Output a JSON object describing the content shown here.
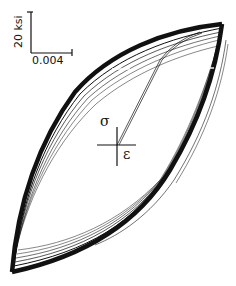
{
  "figure": {
    "type": "stress-strain hysteresis loops (cyclic loading)",
    "scale_bar": {
      "stress_label": "20 ksi",
      "strain_label": "0.004"
    },
    "axes": {
      "stress_symbol": "σ",
      "strain_symbol": "ε"
    },
    "colors": {
      "ink": "#111111",
      "background": "#ffffff"
    }
  }
}
